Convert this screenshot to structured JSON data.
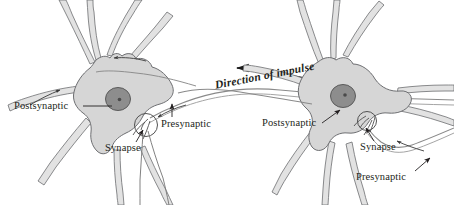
{
  "figure": {
    "background_color": "#ffffff",
    "line_color": "#6d6e71",
    "soma_fill": "#d9d9d9",
    "nucleus_fill": "#8a8a8a",
    "text_color": "#231f20"
  },
  "impulse": {
    "label": "Direction of impulse",
    "arrow_direction": "left",
    "arrow_icon": "long-left-arrow-icon"
  },
  "neurons": [
    {
      "id": "left-neuron",
      "role": "postsynaptic",
      "labels": {
        "postsynaptic": "Postsynaptic",
        "synapse": "Synapse",
        "presynaptic": "Presynaptic"
      }
    },
    {
      "id": "right-neuron",
      "role": "presynaptic",
      "labels": {
        "postsynaptic": "Postsynaptic",
        "synapse": "Synapse",
        "presynaptic": "Presynaptic"
      }
    }
  ],
  "parts": {
    "soma": "cell-body",
    "nucleus": "nucleus",
    "nucleolus": "nucleolus",
    "dendrite": "dendrite",
    "axon": "axon",
    "axon_terminal": "axon-terminal",
    "synapse_circle": "synapse-detail-circle",
    "leader_line": "leader-line",
    "small_arrow": "small-direction-arrow"
  }
}
